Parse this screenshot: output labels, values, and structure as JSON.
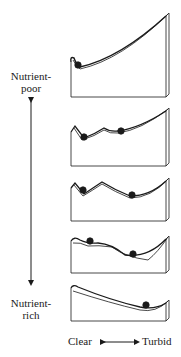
{
  "figure": {
    "y_axis": {
      "top_label_line1": "Nutrient-",
      "top_label_line2": "poor",
      "bottom_label_line1": "Nutrient-",
      "bottom_label_line2": "rich",
      "direction": "bidirectional-vertical"
    },
    "x_axis": {
      "left_label": "Clear",
      "right_label": "Turbid",
      "direction": "bidirectional-horizontal"
    },
    "panels": [
      {
        "index": 1,
        "description": "Single stable state (clear): steep rise to right, ball in left well",
        "balls": 1
      },
      {
        "index": 2,
        "description": "Two stable states; clear basin deeper, turbid basin shallow",
        "balls": 2
      },
      {
        "index": 3,
        "description": "Two stable states of comparable depth",
        "balls": 2
      },
      {
        "index": 4,
        "description": "Two stable states; turbid basin deeper, clear basin shallow",
        "balls": 2
      },
      {
        "index": 5,
        "description": "Single stable state (turbid): slope descends to right, ball in right well",
        "balls": 1
      }
    ],
    "colors": {
      "ink": "#1a1a1a",
      "background": "#ffffff"
    }
  }
}
